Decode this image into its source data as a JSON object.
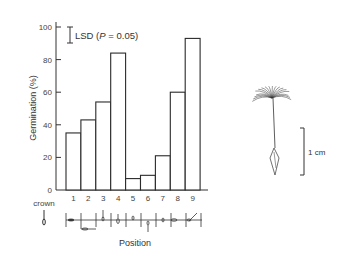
{
  "chart_data": {
    "type": "bar",
    "title": "",
    "xlabel": "Position",
    "ylabel": "Germination (%)",
    "ylim": [
      0,
      100
    ],
    "yticks": [
      0,
      20,
      40,
      60,
      80,
      100
    ],
    "categories": [
      "1",
      "2",
      "3",
      "4",
      "5",
      "6",
      "7",
      "8",
      "9"
    ],
    "values": [
      35,
      43,
      54,
      84,
      7,
      9,
      21,
      60,
      93
    ],
    "grid": false,
    "legend": null,
    "annotations": {
      "lsd_label": "LSD (",
      "lsd_p": "P",
      "lsd_rest": " = 0.05)",
      "crown_label": "crown",
      "scale_bar_label": "1 cm"
    }
  },
  "labels": {
    "ylabel": "Germination (%)",
    "xlabel": "Position",
    "crown": "crown",
    "scale": "1 cm",
    "lsd_prefix": "LSD (",
    "lsd_p": "P",
    "lsd_suffix": " = 0.05)"
  }
}
